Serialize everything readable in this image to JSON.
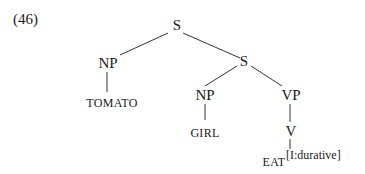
{
  "example_number": "(46)",
  "tree": {
    "root": "S",
    "left_np": "NP",
    "left_np_word": "TOMATO",
    "inner_s": "S",
    "inner_np": "NP",
    "inner_np_word": "GIRL",
    "vp": "VP",
    "v": "V",
    "verb": "EAT",
    "verb_feature": "[I:durative]"
  }
}
